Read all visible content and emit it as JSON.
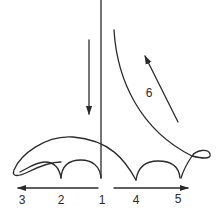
{
  "diagram": {
    "labels": {
      "p1": "1",
      "p2": "2",
      "p3": "3",
      "p4": "4",
      "p5": "5",
      "p6": "6"
    },
    "colors": {
      "stroke": "#2a2a2a",
      "background": "#ffffff"
    },
    "arrows": [
      {
        "name": "down-arrow",
        "direction": "down"
      },
      {
        "name": "arrow-6",
        "direction": "up-left"
      },
      {
        "name": "left-arrow",
        "direction": "left",
        "from": "1",
        "to": "3"
      },
      {
        "name": "right-arrow",
        "direction": "right",
        "from": "1",
        "to": "5"
      }
    ]
  }
}
